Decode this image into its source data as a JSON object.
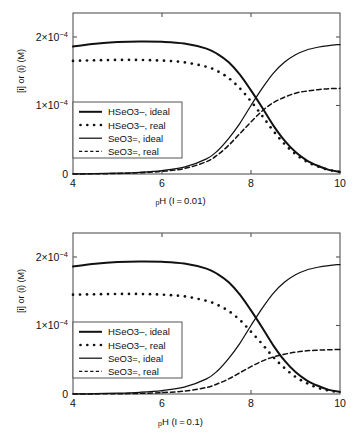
{
  "figure": {
    "panels": [
      {
        "id": "panel-top",
        "xlabel_prefix": "p",
        "xlabel_main": "H (I = 0.01)",
        "ylabel": "[i] or (i) (M)",
        "ionic_strength": "0.01"
      },
      {
        "id": "panel-bottom",
        "xlabel_prefix": "p",
        "xlabel_main": "H (I = 0.1)",
        "ylabel": "[i] or (i) (M)",
        "ionic_strength": "0.1"
      }
    ],
    "axis": {
      "x_ticks": [
        "4",
        "6",
        "8",
        "10"
      ],
      "y_ticks": [
        "0",
        "1×10⁻⁴",
        "2×10⁻⁴"
      ],
      "y_tick_mantissa": [
        "0",
        "1",
        "2"
      ],
      "y_tick_base": "×10",
      "y_tick_exp": "−4"
    },
    "legend": {
      "entries": [
        {
          "label": "HSeO3–, ideal",
          "style": "solid-thick"
        },
        {
          "label": "HSeO3–, real",
          "style": "dotted"
        },
        {
          "label": "SeO3=, ideal",
          "style": "solid-thin"
        },
        {
          "label": "SeO3=, real",
          "style": "dashed"
        }
      ]
    },
    "colors": {
      "ink": "#111111",
      "frame": "#555555",
      "background": "#ffffff"
    }
  },
  "chart_data": [
    {
      "type": "line",
      "title": "Selenite speciation at I = 0.01",
      "xlabel": "pH (I = 0.01)",
      "ylabel": "[i] or (i) (M)",
      "xlim": [
        4,
        10
      ],
      "ylim": [
        0,
        0.000235
      ],
      "grid": false,
      "legend_position": "center-left",
      "x": [
        4.0,
        4.5,
        5.0,
        5.5,
        6.0,
        6.5,
        7.0,
        7.25,
        7.5,
        7.75,
        8.0,
        8.25,
        8.5,
        8.75,
        9.0,
        9.25,
        9.5,
        9.75,
        10.0
      ],
      "series": [
        {
          "name": "HSeO3-, ideal",
          "style": "solid-thick",
          "values": [
            0.000186,
            0.00019,
            0.0001925,
            0.0001935,
            0.000193,
            0.0001905,
            0.000183,
            0.000175,
            0.000163,
            0.000145,
            0.000122,
            9.7e-05,
            7.1e-05,
            4.9e-05,
            3.2e-05,
            2e-05,
            1.2e-05,
            6e-06,
            3e-06
          ]
        },
        {
          "name": "HSeO3-, real",
          "style": "dotted",
          "values": [
            0.000165,
            0.000166,
            0.0001665,
            0.0001665,
            0.0001655,
            0.000163,
            0.0001565,
            0.00015,
            0.00014,
            0.000125,
            0.000106,
            8.5e-05,
            6.3e-05,
            4.4e-05,
            2.9e-05,
            1.8e-05,
            1.1e-05,
            6e-06,
            3e-06
          ]
        },
        {
          "name": "SeO3=, ideal",
          "style": "solid-thin",
          "values": [
            2e-07,
            5e-07,
            1.2e-06,
            2.5e-06,
            5e-06,
            1e-05,
            2.2e-05,
            3.4e-05,
            5.2e-05,
            7.4e-05,
            0.0001,
            0.000125,
            0.000147,
            0.000163,
            0.000174,
            0.000181,
            0.000185,
            0.0001875,
            0.000189
          ]
        },
        {
          "name": "SeO3=, real",
          "style": "dashed",
          "values": [
            1e-07,
            3e-07,
            8e-07,
            1.8e-06,
            3.8e-06,
            8e-06,
            1.8e-05,
            2.8e-05,
            4.2e-05,
            5.9e-05,
            7.6e-05,
            9.2e-05,
            0.000104,
            0.000112,
            0.000118,
            0.000121,
            0.000123,
            0.0001245,
            0.000125
          ]
        }
      ]
    },
    {
      "type": "line",
      "title": "Selenite speciation at I = 0.1",
      "xlabel": "pH (I = 0.1)",
      "ylabel": "[i] or (i) (M)",
      "xlim": [
        4,
        10
      ],
      "ylim": [
        0,
        0.000235
      ],
      "grid": false,
      "legend_position": "center-left",
      "x": [
        4.0,
        4.5,
        5.0,
        5.5,
        6.0,
        6.5,
        7.0,
        7.25,
        7.5,
        7.75,
        8.0,
        8.25,
        8.5,
        8.75,
        9.0,
        9.25,
        9.5,
        9.75,
        10.0
      ],
      "series": [
        {
          "name": "HSeO3-, ideal",
          "style": "solid-thick",
          "values": [
            0.000186,
            0.00019,
            0.0001925,
            0.0001935,
            0.000193,
            0.0001905,
            0.000183,
            0.000175,
            0.000163,
            0.000145,
            0.000122,
            9.7e-05,
            7.1e-05,
            4.9e-05,
            3.2e-05,
            2e-05,
            1.2e-05,
            6e-06,
            3e-06
          ]
        },
        {
          "name": "HSeO3-, real",
          "style": "dotted",
          "values": [
            0.000145,
            0.0001455,
            0.000146,
            0.000146,
            0.000145,
            0.0001425,
            0.000136,
            0.00013,
            0.000121,
            0.000108,
            9.1e-05,
            7.3e-05,
            5.4e-05,
            3.8e-05,
            2.5e-05,
            1.6e-05,
            9e-06,
            5e-06,
            2.5e-06
          ]
        },
        {
          "name": "SeO3=, ideal",
          "style": "solid-thin",
          "values": [
            2e-07,
            5e-07,
            1.2e-06,
            2.5e-06,
            5e-06,
            1e-05,
            2.2e-05,
            3.4e-05,
            5.2e-05,
            7.4e-05,
            0.0001,
            0.000125,
            0.000147,
            0.000163,
            0.000174,
            0.000181,
            0.000185,
            0.0001875,
            0.000189
          ]
        },
        {
          "name": "SeO3=, real",
          "style": "dashed",
          "values": [
            5e-08,
            1.5e-07,
            4e-07,
            9e-07,
            2e-06,
            4.2e-06,
            9.5e-06,
            1.5e-05,
            2.2e-05,
            3.1e-05,
            4e-05,
            4.8e-05,
            5.4e-05,
            5.8e-05,
            6.1e-05,
            6.3e-05,
            6.4e-05,
            6.45e-05,
            6.5e-05
          ]
        }
      ]
    }
  ]
}
